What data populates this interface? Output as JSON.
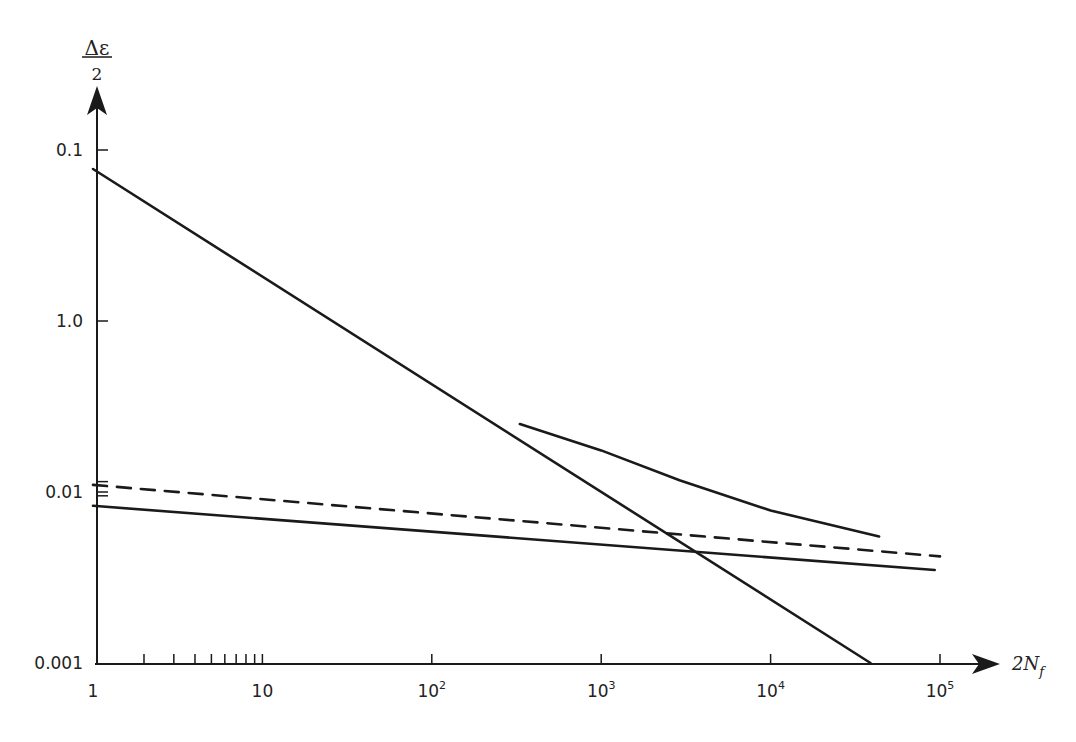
{
  "chart_data": {
    "type": "line",
    "title": "",
    "xlabel": "2N_f",
    "xlabel_main": "2N",
    "xlabel_sub": "f",
    "ylabel_numerator": "Δε",
    "ylabel_denominator": "2",
    "xscale": "log",
    "yscale": "log",
    "xlim": [
      1,
      100000
    ],
    "ylim": [
      0.001,
      1
    ],
    "grid": false,
    "x_ticks": [
      {
        "value": 1,
        "label": "1",
        "sup": ""
      },
      {
        "value": 10,
        "label": "10",
        "sup": ""
      },
      {
        "value": 100,
        "label": "10",
        "sup": "2"
      },
      {
        "value": 1000,
        "label": "10",
        "sup": "3"
      },
      {
        "value": 10000,
        "label": "10",
        "sup": "4"
      },
      {
        "value": 100000,
        "label": "10",
        "sup": "5"
      }
    ],
    "x_minor_ticks": [
      2,
      3,
      4,
      5,
      6,
      7,
      8,
      9
    ],
    "y_ticks": [
      {
        "value": 1,
        "label": "0.1"
      },
      {
        "value": 0.1,
        "label": "1.0"
      },
      {
        "value": 0.01,
        "label": "0.01"
      },
      {
        "value": 0.001,
        "label": "0.001"
      }
    ],
    "y_extra_ticks": [
      0.0115,
      0.0095
    ],
    "series": [
      {
        "name": "steep-line",
        "style": "solid",
        "x": [
          1,
          38900
        ],
        "y": [
          0.774,
          0.001
        ]
      },
      {
        "name": "upper-curve",
        "style": "solid",
        "x": [
          331,
          1000,
          2900,
          10000,
          43700
        ],
        "y": [
          0.025,
          0.0175,
          0.0117,
          0.0078,
          0.0055
        ]
      },
      {
        "name": "dashed-line",
        "style": "dashed",
        "x": [
          1,
          100000
        ],
        "y": [
          0.011,
          0.0042
        ]
      },
      {
        "name": "lower-line",
        "style": "solid",
        "x": [
          1,
          93000
        ],
        "y": [
          0.0083,
          0.0035
        ]
      }
    ]
  }
}
